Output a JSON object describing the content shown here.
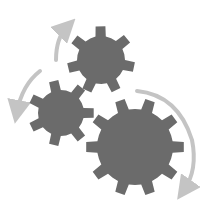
{
  "illustration": {
    "subject": "three interlocking gears with rotation arrows",
    "colors": {
      "background": "#ffffff",
      "gear": "#6b6b6b",
      "arrow": "#c4c4c4"
    },
    "gears": [
      {
        "name": "top-gear",
        "cx": 101,
        "cy": 60,
        "r_body": 24,
        "r_tip": 34,
        "teeth": 7,
        "rotation": 12
      },
      {
        "name": "left-gear",
        "cx": 61,
        "cy": 113,
        "r_body": 23,
        "r_tip": 33,
        "teeth": 7,
        "rotation": 0
      },
      {
        "name": "large-gear",
        "cx": 135,
        "cy": 147,
        "r_body": 38,
        "r_tip": 49,
        "teeth": 10,
        "rotation": 0
      }
    ]
  }
}
